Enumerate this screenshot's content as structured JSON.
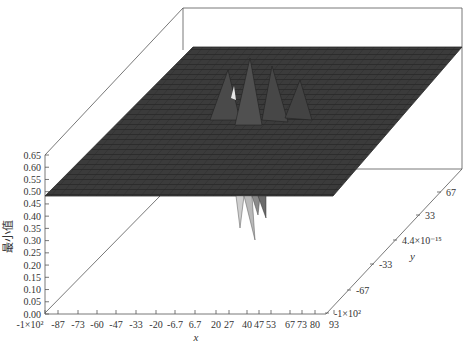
{
  "chart_data": {
    "type": "surface3d",
    "title": "",
    "xlabel": "x",
    "ylabel": "y",
    "zlabel": "最小值",
    "x_ticks": [
      "-1×10²",
      "-87",
      "-73",
      "-60",
      "-47",
      "-33",
      "-20",
      "-6.7",
      "6.7",
      "20",
      "27",
      "40",
      "47",
      "53",
      "67",
      "73",
      "80",
      "93"
    ],
    "y_ticks": [
      "-1×10²",
      "-67",
      "-33",
      "4.4×10⁻¹⁵",
      "33",
      "67"
    ],
    "z_ticks": [
      "0.00",
      "0.05",
      "0.10",
      "0.15",
      "0.20",
      "0.25",
      "0.30",
      "0.35",
      "0.40",
      "0.45",
      "0.50",
      "0.55",
      "0.60",
      "0.65"
    ],
    "xlim": [
      -100,
      100
    ],
    "ylim": [
      -100,
      100
    ],
    "zlim": [
      0.0,
      0.65
    ],
    "surface": {
      "baseline_z": 0.5,
      "description": "Mostly flat surface at z≈0.50 with noisy mesh; a localized ridge/peak cluster near x≈0, y≈0 rising toward ~0.6 and a few downward spikes dropping to ~0.40 near the center.",
      "center_peak_z": 0.6,
      "center_dip_z": 0.4
    },
    "grid": false,
    "legend": null,
    "colors": {
      "surface": "#3a3a3a",
      "mesh": "#1e1e1e",
      "frame": "#555555",
      "spike_light": "#c8c8c8"
    }
  },
  "labels": {
    "zlabel": "最小值",
    "xlabel": "x",
    "ylabel": "y"
  }
}
